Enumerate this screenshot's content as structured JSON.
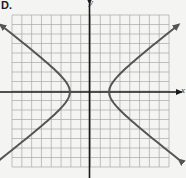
{
  "panel_label": "D.",
  "colors": {
    "background": "#f4f4f2",
    "grid": "#a8a8a8",
    "axes": "#1a1a1a",
    "curve": "#555555"
  },
  "chart_data": {
    "type": "line",
    "title": "",
    "xlabel": "x",
    "ylabel": "y",
    "grid": true,
    "xlim": [
      -8,
      8
    ],
    "ylim": [
      -8,
      8
    ],
    "tick_labels": false,
    "equation": "x^2/4 - y^2/2.56 = 1",
    "a": 2,
    "b": 1.6,
    "vertices": [
      [
        -2,
        0
      ],
      [
        2,
        0
      ]
    ],
    "series": [
      {
        "name": "right-branch",
        "x_range": [
          2,
          9.1
        ],
        "sample_points": [
          [
            2,
            0
          ],
          [
            3.5,
            2.3
          ],
          [
            5,
            3.67
          ],
          [
            7,
            5.37
          ],
          [
            9.1,
            7.1
          ],
          [
            9.1,
            -7.1
          ]
        ]
      },
      {
        "name": "left-branch",
        "x_range": [
          -9.1,
          -2
        ],
        "sample_points": [
          [
            -2,
            0
          ],
          [
            -3.5,
            2.3
          ],
          [
            -5,
            3.67
          ],
          [
            -7,
            5.37
          ],
          [
            -9.1,
            7.1
          ],
          [
            -9.1,
            -7.1
          ]
        ]
      }
    ]
  },
  "layout": {
    "grid_left": 12,
    "grid_right": 169,
    "grid_top": 15,
    "grid_bottom": 167,
    "cells": 16,
    "origin_px": [
      89.5,
      92
    ],
    "x_axis_extent": [
      0,
      182
    ],
    "y_axis_extent": [
      4,
      178
    ]
  }
}
